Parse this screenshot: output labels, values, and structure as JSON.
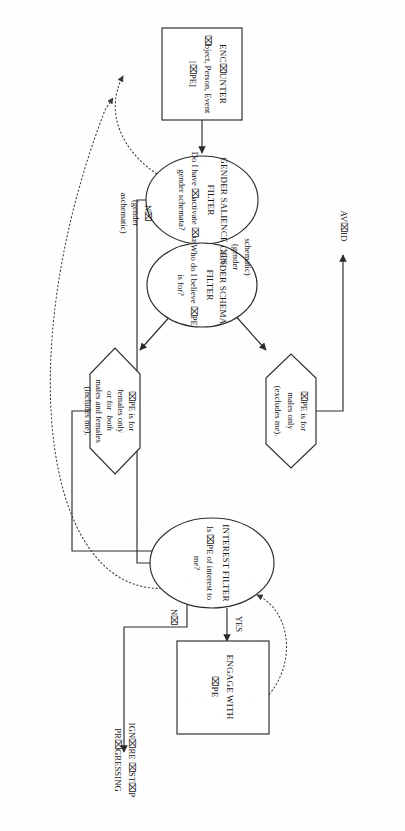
{
  "figure": {
    "type": "flowchart",
    "orientation": "rotated-90-landscape-on-portrait-page",
    "reading_direction": "bottom-to-top",
    "note_on_glyphs": "The letter O renders as a missing-glyph box in this scan",
    "colors": {
      "page_background": "#fefefe",
      "stroke": "#2b2b2b",
      "text": "#151515",
      "dotted_stroke": "#3a3a3a"
    }
  },
  "nodes": {
    "encounter": {
      "shape": "rectangle",
      "line1": "ENC⌧UNTER",
      "line2": "⌧bject, Person, Event",
      "line3": "[⌧PE]"
    },
    "gender_salience_filter": {
      "shape": "ellipse",
      "line1": "GENDER SALIENCE",
      "line2": "FILTER",
      "line3": "Do I have ⌧activate ⌧use",
      "line4": "gender schemata?"
    },
    "gender_schema_filter": {
      "shape": "ellipse",
      "line1": "GENDER SCHEMA",
      "line2": "FILTER",
      "line3": "Who do I believe ⌧PE",
      "line4": "is for?"
    },
    "hex_males_only": {
      "shape": "hexagon",
      "line1": "⌧PE is for",
      "line2": "males only",
      "line3": "(excludes me)."
    },
    "hex_females_both": {
      "shape": "hexagon",
      "line1": "⌧PE is for",
      "line2": "females only",
      "line3": "or for",
      "line3_italic": "both",
      "line4": "males and females",
      "line5": "(includes me)."
    },
    "interest_filter": {
      "shape": "ellipse",
      "line1": "INTEREST FILTER",
      "line2": "Is ⌧PE of interest to",
      "line3": "me?"
    },
    "engage": {
      "shape": "rectangle",
      "line1": "ENGAGE WITH",
      "line2": "⌧PE"
    }
  },
  "terminals": {
    "avoid": "AV⌧ID",
    "ignore_stop": {
      "line1": "IGN⌧RE ⌧ST⌧P",
      "line2": "PR⌧GRESSING"
    }
  },
  "edge_labels": {
    "salience_yes": {
      "line1": "YES",
      "line2": "(gender",
      "line3": "schematic)"
    },
    "salience_no": {
      "line1": "N⌧",
      "line2": "(gender",
      "line3": "aschematic)"
    },
    "interest_yes": "YES",
    "interest_no": "N⌧"
  },
  "edges": [
    {
      "from": "encounter",
      "to": "gender_salience_filter",
      "style": "solid",
      "label": ""
    },
    {
      "from": "gender_salience_filter",
      "to": "gender_schema_filter",
      "style": "solid",
      "label": "YES (gender schematic)"
    },
    {
      "from": "gender_salience_filter",
      "to": "interest_filter",
      "style": "solid",
      "label": "N⌧ (gender aschematic)"
    },
    {
      "from": "gender_schema_filter",
      "to": "hex_males_only",
      "style": "solid",
      "label": ""
    },
    {
      "from": "gender_schema_filter",
      "to": "hex_females_both",
      "style": "solid",
      "label": ""
    },
    {
      "from": "hex_males_only",
      "to": "avoid",
      "style": "solid",
      "label": ""
    },
    {
      "from": "hex_females_both",
      "to": "interest_filter",
      "style": "solid",
      "label": ""
    },
    {
      "from": "interest_filter",
      "to": "engage",
      "style": "solid",
      "label": "YES"
    },
    {
      "from": "interest_filter",
      "to": "ignore_stop",
      "style": "solid",
      "label": "N⌧"
    },
    {
      "from": "engage",
      "to": "interest_filter",
      "style": "dotted",
      "label": ""
    },
    {
      "from": "encounter",
      "to": "gender_salience_filter",
      "style": "dotted",
      "label": "feedback loop"
    },
    {
      "from": "interest_filter",
      "to": "encounter",
      "style": "dotted",
      "label": "feedback loop"
    }
  ]
}
